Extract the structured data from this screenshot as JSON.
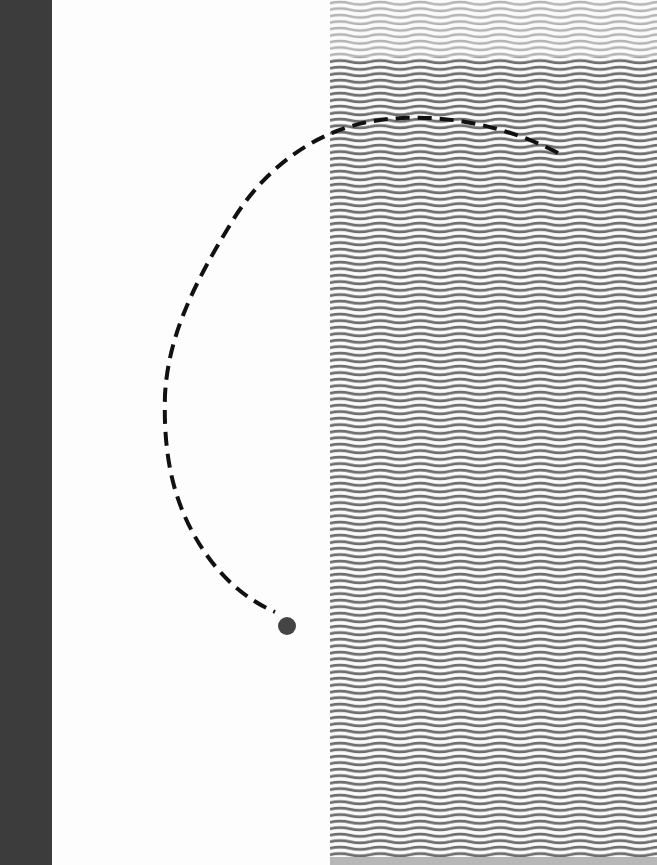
{
  "artwork": {
    "canvas": {
      "width": 657,
      "height": 865,
      "background": "#fdfdfd"
    },
    "left_bar": {
      "x": 0,
      "width": 52,
      "color": "#3c3c3c"
    },
    "wave_field": {
      "x": 330,
      "width": 327,
      "line_spacing": 6.5,
      "wavelength": 40,
      "amplitude": 2,
      "stroke_width": 3,
      "light_band": {
        "y_start": 0,
        "y_end": 57,
        "color": "#b4b4b4"
      },
      "dark_band": {
        "y_start": 57,
        "y_end": 865,
        "color": "#6e6e6e"
      }
    },
    "dashed_arc": {
      "color": "#111111",
      "stroke_width": 4,
      "dash": "14 8",
      "start": [
        558,
        153
      ],
      "end": [
        275,
        610
      ]
    },
    "dot": {
      "cx": 287,
      "cy": 626,
      "r": 9,
      "color": "#444444"
    }
  }
}
